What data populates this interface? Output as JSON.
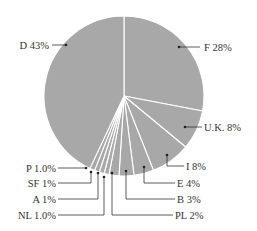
{
  "chart_data": {
    "type": "pie",
    "title": "",
    "start_angle_deg": 0,
    "direction": "clockwise",
    "slice_color": "#a8a8a8",
    "separator_color": "#ffffff",
    "label_color": "#333333",
    "categories": [
      "F",
      "U.K.",
      "I",
      "E",
      "B",
      "PL",
      "NL",
      "A",
      "SF",
      "P",
      "D"
    ],
    "values": [
      28,
      8,
      8,
      4,
      3,
      2,
      1.0,
      1,
      1,
      1.0,
      43
    ],
    "labels": [
      "F 28%",
      "U.K. 8%",
      "I 8%",
      "E 4%",
      "B 3%",
      "PL 2%",
      "NL 1.0%",
      "A 1%",
      "SF 1%",
      "P 1.0%",
      "D 43%"
    ]
  },
  "geometry": {
    "cx": 124,
    "cy": 96,
    "r": 80
  },
  "annotations": [
    {
      "label": "F 28%",
      "dot": [
        179,
        47
      ],
      "path": [
        [
          179,
          47
        ],
        [
          200,
          47
        ]
      ],
      "text_x": 204,
      "text_y": 51,
      "anchor": "start"
    },
    {
      "label": "U.K. 8%",
      "dot": [
        185,
        127
      ],
      "path": [
        [
          185,
          127
        ],
        [
          202,
          127
        ]
      ],
      "text_x": 204,
      "text_y": 131,
      "anchor": "start"
    },
    {
      "label": "I 8%",
      "dot": [
        167,
        155
      ],
      "path": [
        [
          167,
          155
        ],
        [
          167,
          166
        ],
        [
          184,
          166
        ]
      ],
      "text_x": 186,
      "text_y": 170,
      "anchor": "start"
    },
    {
      "label": "E 4%",
      "dot": [
        144,
        167
      ],
      "path": [
        [
          144,
          167
        ],
        [
          144,
          183
        ],
        [
          175,
          183
        ]
      ],
      "text_x": 177,
      "text_y": 187,
      "anchor": "start"
    },
    {
      "label": "B 3%",
      "dot": [
        126,
        171
      ],
      "path": [
        [
          126,
          171
        ],
        [
          126,
          199
        ],
        [
          175,
          199
        ]
      ],
      "text_x": 177,
      "text_y": 203,
      "anchor": "start"
    },
    {
      "label": "PL 2%",
      "dot": [
        112,
        173
      ],
      "path": [
        [
          112,
          173
        ],
        [
          112,
          215
        ],
        [
          173,
          215
        ]
      ],
      "text_x": 175,
      "text_y": 219,
      "anchor": "start"
    },
    {
      "label": "NL 1.0%",
      "dot": [
        104,
        177
      ],
      "path": [
        [
          104,
          177
        ],
        [
          104,
          215
        ],
        [
          58,
          215
        ]
      ],
      "text_x": 56,
      "text_y": 219,
      "anchor": "end"
    },
    {
      "label": "A 1%",
      "dot": [
        98,
        173
      ],
      "path": [
        [
          98,
          173
        ],
        [
          98,
          199
        ],
        [
          58,
          199
        ]
      ],
      "text_x": 56,
      "text_y": 203,
      "anchor": "end"
    },
    {
      "label": "SF 1%",
      "dot": [
        91,
        172
      ],
      "path": [
        [
          91,
          172
        ],
        [
          91,
          183
        ],
        [
          58,
          183
        ]
      ],
      "text_x": 56,
      "text_y": 187,
      "anchor": "end"
    },
    {
      "label": "P 1.0%",
      "dot": [
        86,
        168
      ],
      "path": [
        [
          86,
          168
        ],
        [
          58,
          168
        ]
      ],
      "text_x": 56,
      "text_y": 172,
      "anchor": "end"
    },
    {
      "label": "D 43%",
      "dot": [
        66,
        45
      ],
      "path": [
        [
          66,
          45
        ],
        [
          52,
          45
        ]
      ],
      "text_x": 49,
      "text_y": 49,
      "anchor": "end"
    }
  ]
}
